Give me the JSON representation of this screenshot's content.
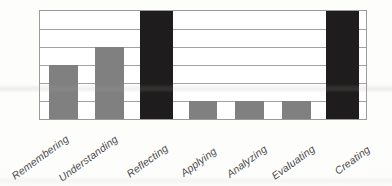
{
  "chart_data": {
    "type": "bar",
    "title": "",
    "subtitle": "",
    "xlabel": "",
    "ylabel": "",
    "categories": [
      "Remembering",
      "Understanding",
      "Reflecting",
      "Applying",
      "Analyzing",
      "Evaluating",
      "Creating"
    ],
    "values": [
      3,
      4,
      6,
      1,
      1,
      1,
      6
    ],
    "bar_colors": [
      "#808080",
      "#808080",
      "#1e1c1c",
      "#808080",
      "#808080",
      "#808080",
      "#1e1c1c"
    ],
    "ylim": [
      0,
      6
    ],
    "yticks": [
      0,
      1,
      2,
      3,
      4,
      5,
      6
    ],
    "ytick_labels": [
      "",
      "",
      "",
      "",
      "",
      "",
      ""
    ],
    "grid": true,
    "grid_axis": "y",
    "grid_color": "#a2a2a2",
    "legend": false,
    "legend_position": "none",
    "axis_border_color": "#9a9a9a",
    "plot_background": "#ffffff",
    "label_rotation_degrees": -36,
    "label_style": "italic",
    "annotations": []
  },
  "figure": {
    "background": "#fdfdfc",
    "accent_color": "#808080",
    "highlight_color": "#1e1c1c"
  }
}
